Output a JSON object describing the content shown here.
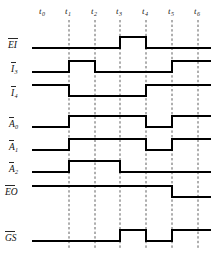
{
  "diagram": {
    "type": "digital-timing-diagram",
    "title": "",
    "background_color": "#ffffff",
    "wave_color": "#000000",
    "grid_color": "#4d4d4d",
    "label_color": "#111111"
  },
  "time_axis": {
    "ticks": [
      {
        "id": "t0",
        "base": "t",
        "sub": "0",
        "x": 43
      },
      {
        "id": "t1",
        "base": "t",
        "sub": "1",
        "x": 69
      },
      {
        "id": "t2",
        "base": "t",
        "sub": "2",
        "x": 95
      },
      {
        "id": "t3",
        "base": "t",
        "sub": "3",
        "x": 120
      },
      {
        "id": "t4",
        "base": "t",
        "sub": "4",
        "x": 146
      },
      {
        "id": "t5",
        "base": "t",
        "sub": "5",
        "x": 172
      },
      {
        "id": "t6",
        "base": "t",
        "sub": "6",
        "x": 198
      }
    ],
    "label_y": 14,
    "gridline_top": 20,
    "gridline_bottom": 250,
    "gridline_ticks": [
      "t1",
      "t2",
      "t3",
      "t4",
      "t5",
      "t6"
    ]
  },
  "signals": [
    {
      "name": "EI",
      "base": "EI",
      "sub": "",
      "overbar": true,
      "active_low": true,
      "label_x": 8,
      "label_y": 48,
      "high_y": 37,
      "low_y": 48,
      "segments": [
        {
          "from": "t0",
          "to": "t3",
          "level": "low"
        },
        {
          "from": "t3",
          "to": "t4",
          "level": "high"
        },
        {
          "from": "t4",
          "to": "t6",
          "level": "low"
        }
      ]
    },
    {
      "name": "I3",
      "base": "I",
      "sub": "3",
      "overbar": true,
      "active_low": true,
      "label_x": 11,
      "label_y": 72,
      "high_y": 61,
      "low_y": 72,
      "segments": [
        {
          "from": "t0",
          "to": "t1",
          "level": "low"
        },
        {
          "from": "t1",
          "to": "t2",
          "level": "high"
        },
        {
          "from": "t2",
          "to": "t5",
          "level": "low"
        },
        {
          "from": "t5",
          "to": "t6",
          "level": "high"
        }
      ]
    },
    {
      "name": "I4",
      "base": "I",
      "sub": "4",
      "overbar": true,
      "active_low": true,
      "label_x": 11,
      "label_y": 96,
      "high_y": 85,
      "low_y": 96,
      "segments": [
        {
          "from": "t0",
          "to": "t1",
          "level": "high"
        },
        {
          "from": "t1",
          "to": "t4",
          "level": "low"
        },
        {
          "from": "t4",
          "to": "t6",
          "level": "high"
        }
      ]
    },
    {
      "name": "A0",
      "base": "A",
      "sub": "0",
      "overbar": true,
      "active_low": true,
      "label_x": 9,
      "label_y": 127,
      "high_y": 116,
      "low_y": 127,
      "segments": [
        {
          "from": "t0",
          "to": "t1",
          "level": "low"
        },
        {
          "from": "t1",
          "to": "t4",
          "level": "high"
        },
        {
          "from": "t4",
          "to": "t5",
          "level": "low"
        },
        {
          "from": "t5",
          "to": "t6",
          "level": "high"
        }
      ]
    },
    {
      "name": "A1",
      "base": "A",
      "sub": "1",
      "overbar": true,
      "active_low": true,
      "label_x": 9,
      "label_y": 150,
      "high_y": 139,
      "low_y": 150,
      "segments": [
        {
          "from": "t0",
          "to": "t1",
          "level": "low"
        },
        {
          "from": "t1",
          "to": "t4",
          "level": "high"
        },
        {
          "from": "t4",
          "to": "t5",
          "level": "low"
        },
        {
          "from": "t5",
          "to": "t6",
          "level": "high"
        }
      ]
    },
    {
      "name": "A2",
      "base": "A",
      "sub": "2",
      "overbar": true,
      "active_low": true,
      "label_x": 9,
      "label_y": 172,
      "high_y": 161,
      "low_y": 172,
      "segments": [
        {
          "from": "t0",
          "to": "t1",
          "level": "low"
        },
        {
          "from": "t1",
          "to": "t3",
          "level": "high"
        },
        {
          "from": "t3",
          "to": "t6",
          "level": "low"
        }
      ]
    },
    {
      "name": "EO",
      "base": "EO",
      "sub": "",
      "overbar": true,
      "active_low": true,
      "label_x": 5,
      "label_y": 195,
      "high_y": 186,
      "low_y": 197,
      "segments": [
        {
          "from": "t0",
          "to": "t5",
          "level": "high"
        },
        {
          "from": "t5",
          "to": "t6",
          "level": "low"
        }
      ]
    },
    {
      "name": "GS",
      "base": "GS",
      "sub": "",
      "overbar": true,
      "active_low": true,
      "label_x": 5,
      "label_y": 241,
      "high_y": 230,
      "low_y": 241,
      "segments": [
        {
          "from": "t0",
          "to": "t3",
          "level": "low"
        },
        {
          "from": "t3",
          "to": "t4",
          "level": "high"
        },
        {
          "from": "t4",
          "to": "t5",
          "level": "low"
        },
        {
          "from": "t5",
          "to": "t6",
          "level": "high"
        }
      ]
    }
  ],
  "geometry": {
    "wave_start_x": 32,
    "wave_end_x": 211
  }
}
